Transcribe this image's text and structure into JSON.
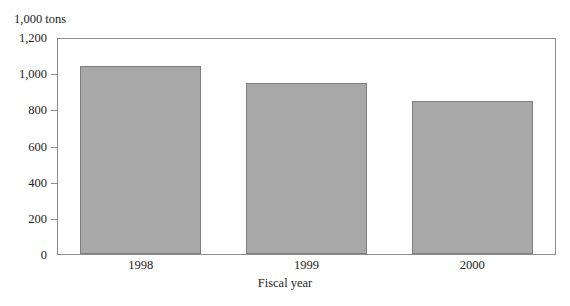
{
  "figure": {
    "unit_label": "1,000 tons",
    "top_remnant_text": "",
    "bar_color": "#a8a8a8",
    "bar_border_color": "#7e7e7e",
    "frame_color": "#8d8d8d",
    "text_color": "#1d1d1d"
  },
  "chart_data": {
    "type": "bar",
    "title": "",
    "xlabel": "Fiscal year",
    "ylabel": "1,000 tons",
    "categories": [
      "1998",
      "1999",
      "2000"
    ],
    "values": [
      1050,
      955,
      855
    ],
    "series": [
      {
        "name": "1,000 tons",
        "values": [
          1050,
          955,
          855
        ]
      }
    ],
    "ylim": [
      0,
      1200
    ],
    "yticks": [
      0,
      200,
      400,
      600,
      800,
      1000,
      1200
    ],
    "ytick_labels": [
      "0",
      "200",
      "400",
      "600",
      "800",
      "1,000",
      "1,200"
    ],
    "grid": false,
    "legend": false,
    "legend_position": "none"
  }
}
